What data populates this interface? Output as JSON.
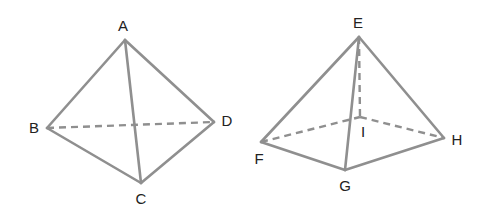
{
  "figures": [
    {
      "name": "tetrahedron",
      "vertices": {
        "A": {
          "label": "A",
          "x": 125,
          "y": 40,
          "lx": 123,
          "ly": 27
        },
        "B": {
          "label": "B",
          "x": 47,
          "y": 128,
          "lx": 34,
          "ly": 129
        },
        "C": {
          "label": "C",
          "x": 141,
          "y": 183,
          "lx": 141,
          "ly": 200
        },
        "D": {
          "label": "D",
          "x": 214,
          "y": 122,
          "lx": 227,
          "ly": 122
        }
      },
      "solid_edges": [
        "AB",
        "AD",
        "AC",
        "BC",
        "CD"
      ],
      "dashed_edges": [
        "BD"
      ]
    },
    {
      "name": "square-pyramid",
      "vertices": {
        "E": {
          "label": "E",
          "x": 359,
          "y": 37,
          "lx": 358,
          "ly": 24
        },
        "F": {
          "label": "F",
          "x": 261,
          "y": 142,
          "lx": 259,
          "ly": 160
        },
        "G": {
          "label": "G",
          "x": 345,
          "y": 170,
          "lx": 345,
          "ly": 187
        },
        "H": {
          "label": "H",
          "x": 444,
          "y": 138,
          "lx": 457,
          "ly": 141
        },
        "I": {
          "label": "I",
          "x": 360,
          "y": 117,
          "lx": 363,
          "ly": 133
        }
      },
      "solid_edges": [
        "EF",
        "EG",
        "EH",
        "FG",
        "GH"
      ],
      "dashed_edges": [
        "EI",
        "FI",
        "IH"
      ]
    }
  ],
  "labels": {
    "A": "A",
    "B": "B",
    "C": "C",
    "D": "D",
    "E": "E",
    "F": "F",
    "G": "G",
    "H": "H",
    "I": "I"
  },
  "colors": {
    "edge": "#8f8f8f",
    "label": "#222222"
  }
}
